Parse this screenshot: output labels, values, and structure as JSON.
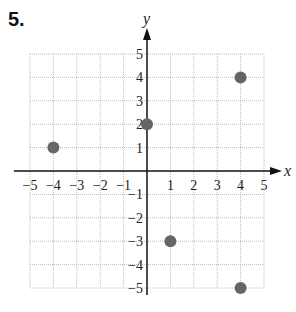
{
  "problem": {
    "number": "5."
  },
  "chart_data": {
    "type": "scatter",
    "title": "",
    "xlabel": "x",
    "ylabel": "y",
    "xlim": [
      -5,
      5
    ],
    "ylim": [
      -5,
      5
    ],
    "grid": true,
    "x_ticks": [
      -5,
      -4,
      -3,
      -2,
      -1,
      1,
      2,
      3,
      4,
      5
    ],
    "y_ticks": [
      -5,
      -4,
      -3,
      -2,
      -1,
      1,
      2,
      3,
      4,
      5
    ],
    "x_tick_labels": [
      "−5",
      "−4",
      "−3",
      "−2",
      "−1",
      "1",
      "2",
      "3",
      "4",
      "5"
    ],
    "y_tick_labels": [
      "−5",
      "−4",
      "−3",
      "−2",
      "−1",
      "1",
      "2",
      "3",
      "4",
      "5"
    ],
    "points": [
      {
        "x": -4,
        "y": 1
      },
      {
        "x": 0,
        "y": 2
      },
      {
        "x": 4,
        "y": 4
      },
      {
        "x": 1,
        "y": -3
      },
      {
        "x": 4,
        "y": -5
      }
    ],
    "colors": {
      "point": "#666666",
      "grid": "#bbbbbb",
      "axis": "#111111"
    }
  }
}
